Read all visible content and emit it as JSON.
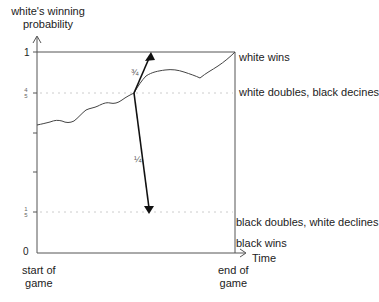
{
  "y_axis": {
    "title_line1": "white's winning",
    "title_line2": "probability",
    "ticks": [
      {
        "label": "1",
        "value": 1
      },
      {
        "label_num": "4",
        "label_den": "5",
        "value": 0.8
      },
      {
        "label_num": "1",
        "label_den": "5",
        "value": 0.2
      },
      {
        "label": "0",
        "value": 0
      }
    ]
  },
  "x_axis": {
    "title": "Time",
    "start_line1": "start of",
    "start_line2": "game",
    "end_line1": "end of",
    "end_line2": "game"
  },
  "outcomes": {
    "white_wins": "white wins",
    "white_doubles": "white doubles, black decines",
    "black_doubles": "black doubles, white declines",
    "black_wins": "black wins"
  },
  "arrows": {
    "up_probability": "¾",
    "down_probability": "¼"
  },
  "colors": {
    "axis": "#555555",
    "curve": "#444444",
    "arrow": "#111111",
    "dotted": "#cccccc"
  }
}
